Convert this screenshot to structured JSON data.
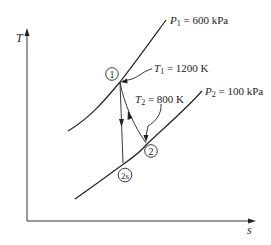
{
  "diagram": {
    "type": "T-s diagram",
    "axes": {
      "y_label": "T",
      "x_label": "s"
    },
    "isobars": [
      {
        "label_var": "P",
        "label_sub": "1",
        "label_value": " = 600 kPa",
        "full_label": "P1 = 600 kPa"
      },
      {
        "label_var": "P",
        "label_sub": "2",
        "label_value": " = 100 kPa",
        "full_label": "P2 = 100 kPa"
      }
    ],
    "states": [
      {
        "id": "1",
        "label": "1"
      },
      {
        "id": "2",
        "label": "2"
      },
      {
        "id": "2s",
        "label": "2s"
      }
    ],
    "annotations": [
      {
        "var": "T",
        "sub": "1",
        "value": " = 1200 K",
        "full": "T1 = 1200 K",
        "points_to": "1"
      },
      {
        "var": "T",
        "sub": "2",
        "value": " = 800 K",
        "full": "T2 = 800 K",
        "points_to": "2"
      }
    ],
    "processes": [
      {
        "from": "1",
        "to": "2s",
        "kind": "isentropic (vertical)"
      },
      {
        "from": "1",
        "to": "2",
        "kind": "actual"
      }
    ],
    "colors": {
      "ink": "#222222",
      "background": "#ffffff"
    }
  }
}
